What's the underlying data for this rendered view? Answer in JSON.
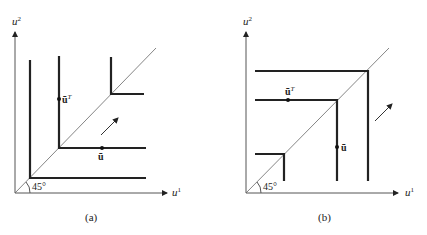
{
  "panels": [
    {
      "id": "a",
      "caption": "(a)",
      "y_axis_label": "u",
      "y_axis_sup": "2",
      "x_axis_label": "u",
      "x_axis_sup": "1",
      "angle_label": "45°",
      "point_upper_label": "ū",
      "point_upper_sup": "T",
      "point_lower_label": "ū",
      "description": "Leontief (L-shaped) indifference curves with corners on the 45° line; arrow indicates direction of increasing preference"
    },
    {
      "id": "b",
      "caption": "(b)",
      "y_axis_label": "u",
      "y_axis_sup": "2",
      "x_axis_label": "u",
      "x_axis_sup": "1",
      "angle_label": "45°",
      "point_upper_label": "ū",
      "point_upper_sup": "T",
      "point_lower_label": "ū",
      "description": "Inverted-L (Γ-shaped) indifference curves with corners on the 45° line; arrow indicates direction of increasing preference"
    }
  ],
  "colors": {
    "curve": "#222222",
    "axis": "#555555",
    "diagonal": "#666666"
  }
}
